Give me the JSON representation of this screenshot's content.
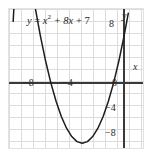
{
  "figure": {
    "background_color": "#ffffff",
    "frame_color": "#e2e2e2",
    "grid_color": "#dcdcdc",
    "axis_color": "#3a3a3a",
    "curve_color": "#1d1d1d",
    "text_color": "#2b2b2b"
  },
  "chart_data": {
    "type": "line",
    "title": "",
    "equation_label": "y = x² + 8x + 7",
    "equation_parts": {
      "lhs": "y",
      "equals": "=",
      "term1_base": "x",
      "term1_exp": "2",
      "term2": "+ 8x",
      "term3": "+ 7"
    },
    "function": "y = x^2 + 8x + 7",
    "xlabel": "x",
    "ylabel": "y",
    "xlim": [
      -11,
      2
    ],
    "ylim": [
      -10,
      11
    ],
    "grid": true,
    "grid_step": 1,
    "legend": "none",
    "x_tick_labels": [
      "−8",
      "−4"
    ],
    "x_tick_values": [
      -8,
      -4
    ],
    "y_tick_labels": [
      "8",
      "0",
      "−4",
      "−8"
    ],
    "y_tick_values": [
      8,
      0,
      -4,
      -8
    ],
    "roots": [
      -7,
      -1
    ],
    "vertex": [
      -4,
      -9
    ],
    "y_intercept": 7,
    "x": [
      -10.6,
      -10,
      -9.5,
      -9,
      -8.5,
      -8,
      -7.5,
      -7,
      -6.5,
      -6,
      -5.5,
      -5,
      -4.5,
      -4,
      -3.5,
      -3,
      -2.5,
      -2,
      -1.5,
      -1,
      -0.5,
      0,
      0.4
    ],
    "values": [
      9.16,
      27,
      21.25,
      16,
      11.25,
      7,
      3.25,
      0,
      -2.75,
      -5,
      -6.75,
      -8,
      -8.75,
      -9,
      -8.75,
      -8,
      -6.75,
      -5,
      -2.75,
      0,
      3.25,
      7,
      10.36
    ]
  },
  "axis_names": {
    "x": "x",
    "y": "y"
  }
}
